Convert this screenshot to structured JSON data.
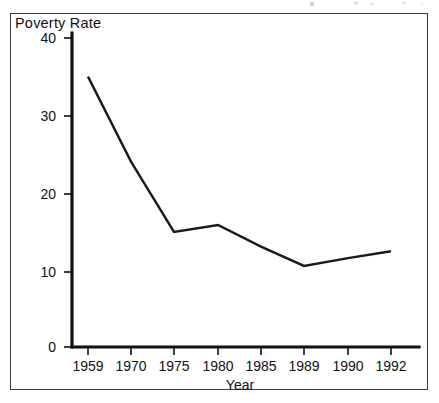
{
  "figure": {
    "frame_color": "#3b3b3b",
    "background": "#ffffff",
    "line_color": "#1a1a1a"
  },
  "chart_data": {
    "type": "line",
    "title": "Poverty Rate",
    "xlabel": "Year",
    "ylabel": "",
    "categories": [
      "1959",
      "1970",
      "1975",
      "1980",
      "1985",
      "1989",
      "1990",
      "1992"
    ],
    "values": [
      35.0,
      24.0,
      14.9,
      15.8,
      13.0,
      10.5,
      11.5,
      12.4
    ],
    "series": [
      {
        "name": "Poverty Rate",
        "values": [
          35.0,
          24.0,
          14.9,
          15.8,
          13.0,
          10.5,
          11.5,
          12.4
        ]
      }
    ],
    "ylim": [
      0,
      40
    ],
    "yticks": [
      0,
      10,
      20,
      30,
      40
    ],
    "ytick_labels": [
      "0",
      "10",
      "20",
      "30",
      "40"
    ],
    "xtick_labels": [
      "1959",
      "1970",
      "1975",
      "1980",
      "1985",
      "1989",
      "1990",
      "1992"
    ],
    "grid": false,
    "legend": "none",
    "axis_type": "categorical"
  }
}
